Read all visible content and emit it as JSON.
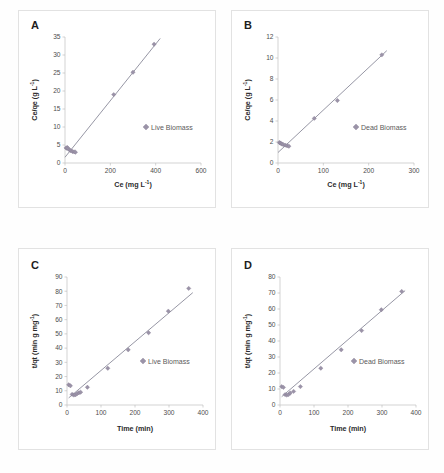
{
  "figure": {
    "background": "#ffffff",
    "marker_color": "#9b93a8",
    "line_color": "#8a8a9a",
    "panels": [
      "A",
      "B",
      "C",
      "D"
    ]
  },
  "chart_data": [
    {
      "panel": "A",
      "type": "scatter",
      "title": "",
      "xlabel": "Ce (mg L⁻¹)",
      "ylabel": "Ce/qe (g L⁻¹)",
      "xlim": [
        0,
        600
      ],
      "ylim": [
        0,
        35
      ],
      "xticks": [
        0,
        200,
        400,
        600
      ],
      "yticks": [
        0,
        5,
        10,
        15,
        20,
        25,
        30,
        35
      ],
      "grid": false,
      "legend": [
        "Live Biomass"
      ],
      "legend_position": "center-right",
      "series": [
        {
          "name": "Live Biomass",
          "x": [
            5,
            8,
            10,
            14,
            20,
            26,
            33,
            40,
            46,
            215,
            300,
            393
          ],
          "y": [
            4.2,
            4.1,
            4.3,
            4.0,
            3.6,
            3.4,
            3.2,
            3.1,
            3.0,
            19.0,
            25.2,
            33.0
          ]
        }
      ],
      "fit": {
        "type": "linear",
        "x": [
          0,
          420
        ],
        "y": [
          1.6,
          34.6
        ]
      }
    },
    {
      "panel": "B",
      "type": "scatter",
      "title": "",
      "xlabel": "Ce (mg L⁻¹)",
      "ylabel": "Ce/qe (g L⁻¹)",
      "xlim": [
        0,
        300
      ],
      "ylim": [
        0,
        12
      ],
      "xticks": [
        0,
        100,
        200,
        300
      ],
      "yticks": [
        0,
        2,
        4,
        6,
        8,
        10,
        12
      ],
      "grid": false,
      "legend": [
        "Dead Biomass"
      ],
      "legend_position": "center-right",
      "series": [
        {
          "name": "Dead Biomass",
          "x": [
            3,
            5,
            7,
            9,
            12,
            16,
            20,
            24,
            80,
            131,
            229
          ],
          "y": [
            1.95,
            1.9,
            1.85,
            1.8,
            1.75,
            1.7,
            1.65,
            1.6,
            4.25,
            5.95,
            10.3
          ]
        }
      ],
      "fit": {
        "type": "linear",
        "x": [
          0,
          240
        ],
        "y": [
          1.0,
          10.7
        ]
      }
    },
    {
      "panel": "C",
      "type": "scatter",
      "title": "",
      "xlabel": "Time (min)",
      "ylabel": "t/qt (min g mg⁻¹)",
      "xlim": [
        0,
        400
      ],
      "ylim": [
        0,
        90
      ],
      "xticks": [
        0,
        100,
        200,
        300,
        400
      ],
      "yticks": [
        0,
        10,
        20,
        30,
        40,
        50,
        60,
        70,
        80,
        90
      ],
      "grid": false,
      "legend": [
        "Live Biomass"
      ],
      "legend_position": "center-right",
      "series": [
        {
          "name": "Live Biomass",
          "x": [
            5,
            10,
            15,
            20,
            25,
            30,
            35,
            40,
            60,
            120,
            180,
            240,
            298,
            358
          ],
          "y": [
            14.2,
            13.5,
            7.5,
            7.0,
            7.2,
            8.0,
            8.6,
            9.0,
            12.5,
            25.8,
            38.8,
            50.8,
            66.0,
            82.0
          ]
        }
      ],
      "fit": {
        "type": "linear",
        "x": [
          5,
          370
        ],
        "y": [
          5.0,
          79.0
        ]
      }
    },
    {
      "panel": "D",
      "type": "scatter",
      "title": "",
      "xlabel": "Time (min)",
      "ylabel": "t/qt (min g mg⁻¹)",
      "xlim": [
        0,
        400
      ],
      "ylim": [
        0,
        80
      ],
      "xticks": [
        0,
        100,
        200,
        300,
        400
      ],
      "yticks": [
        0,
        10,
        20,
        30,
        40,
        50,
        60,
        70,
        80
      ],
      "grid": false,
      "legend": [
        "Dead Biomass"
      ],
      "legend_position": "center-right",
      "series": [
        {
          "name": "Dead Biomass",
          "x": [
            5,
            10,
            15,
            20,
            25,
            30,
            40,
            60,
            120,
            180,
            240,
            298,
            358
          ],
          "y": [
            11.5,
            11.0,
            6.5,
            6.2,
            6.5,
            7.5,
            8.5,
            11.5,
            23.0,
            34.5,
            46.5,
            59.5,
            71.0
          ]
        }
      ],
      "fit": {
        "type": "linear",
        "x": [
          5,
          368
        ],
        "y": [
          5.2,
          71.5
        ]
      }
    }
  ],
  "panelA": {
    "letter": "A",
    "legend": "Live Biomass",
    "xlabel_main": "Ce (mg L",
    "xlabel_sup": "-1",
    "xlabel_end": ")",
    "ylabel_main": "Ce/qe (g L",
    "ylabel_sup": "-1",
    "ylabel_end": ")"
  },
  "panelB": {
    "letter": "B",
    "legend": "Dead Biomass",
    "xlabel_main": "Ce (mg L",
    "xlabel_sup": "-1",
    "xlabel_end": ")",
    "ylabel_main": "Ce/qe (g L",
    "ylabel_sup": "-1",
    "ylabel_end": ")"
  },
  "panelC": {
    "letter": "C",
    "legend": "Live Biomass",
    "xlabel_main": "Time (min)",
    "ylabel_main": "t/qt (min g mg",
    "ylabel_sup": "-1",
    "ylabel_end": ")"
  },
  "panelD": {
    "letter": "D",
    "legend": "Dead Biomass",
    "xlabel_main": "Time (min)",
    "ylabel_main": "t/qt (min g mg",
    "ylabel_sup": "-1",
    "ylabel_end": ")"
  }
}
